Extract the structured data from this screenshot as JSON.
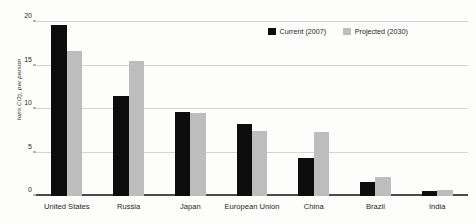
{
  "chart_data": {
    "type": "bar",
    "title": "",
    "subtitle": "",
    "xlabel": "",
    "ylabel": "tons CO2 per person",
    "ylabel_parts": {
      "pre": "tons CO",
      "sub": "2",
      "post": ", per person"
    },
    "categories": [
      "United States",
      "Russia",
      "Japan",
      "European Union",
      "China",
      "Brazil",
      "India"
    ],
    "series": [
      {
        "name": "Current (2007)",
        "color": "#0d0d0d",
        "values": [
          19.7,
          11.5,
          9.6,
          8.3,
          4.4,
          1.6,
          0.6
        ]
      },
      {
        "name": "Projected (2030)",
        "color": "#bdbdbd",
        "values": [
          16.7,
          15.5,
          9.5,
          7.5,
          7.4,
          2.2,
          0.7
        ]
      }
    ],
    "ylim": [
      0,
      20
    ],
    "yticks": [
      0,
      5,
      10,
      15,
      20
    ],
    "ytick_labels": [
      "0",
      "5",
      "10",
      "15",
      "20"
    ],
    "grid": "horizontal",
    "legend_position": "top-right",
    "annotations": []
  },
  "legend": {
    "entries": [
      {
        "label": "Current (2007)",
        "swatch": "#0d0d0d"
      },
      {
        "label": "Projected (2030)",
        "swatch": "#bdbdbd"
      }
    ]
  },
  "colors": {
    "background": "#fdfdfc",
    "gridline": "#d4d4d4",
    "axis": "#4a4a4a",
    "text": "#1d1d1d"
  }
}
